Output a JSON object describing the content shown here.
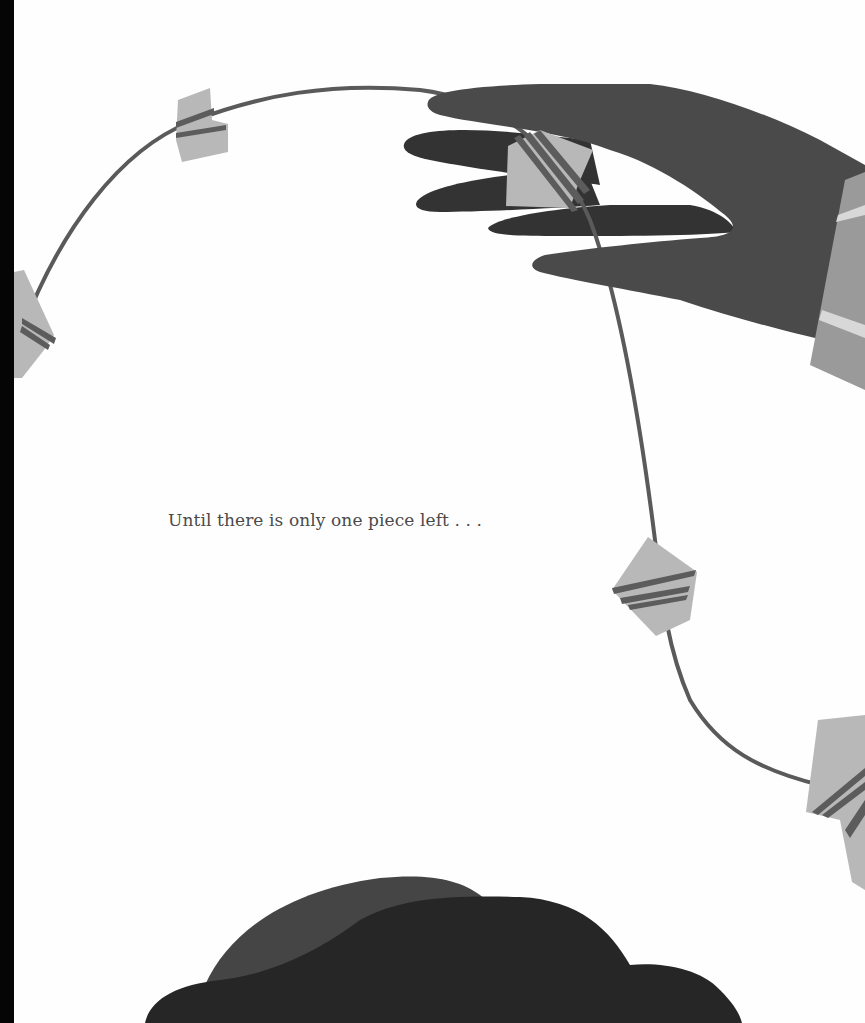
{
  "page": {
    "caption": "Until there is only one piece left . . .",
    "colors": {
      "background": "#fefefe",
      "binding": "#050505",
      "string": "#5a5a5a",
      "piece": "#b8b8b8",
      "piece_stripe": "#5c5c5c",
      "hand": "#4a4a4a",
      "hand_fingers_back": "#333333",
      "sleeve": "#9a9a9a",
      "sleeve_stripe": "#d8d8d8",
      "hair_back": "#454545",
      "hair_front": "#262626",
      "text": "#4a4a4a"
    }
  }
}
